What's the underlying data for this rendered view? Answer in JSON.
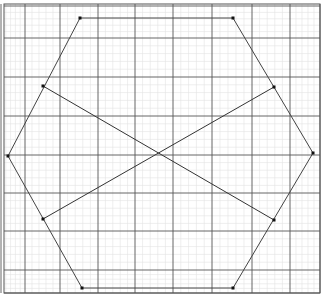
{
  "figure": {
    "grid": {
      "minor_step": 7.7,
      "major_x": [
        1,
        25,
        60,
        98,
        135,
        173,
        212,
        252,
        290,
        320
      ],
      "major_y": [
        6,
        38,
        77,
        116,
        155,
        193,
        231,
        270,
        293
      ],
      "minor_color": "#e2e2e2",
      "major_color": "#555555",
      "border": [
        4,
        4,
        320,
        293
      ]
    },
    "hexagon": {
      "vertices": [
        [
          80,
          18
        ],
        [
          233,
          18
        ],
        [
          313,
          153
        ],
        [
          233,
          288
        ],
        [
          82,
          288
        ],
        [
          8,
          156
        ]
      ],
      "stroke": "#444444"
    },
    "segments": [
      {
        "from": [
          43,
          86
        ],
        "to": [
          274,
          220
        ]
      },
      {
        "from": [
          43,
          219
        ],
        "to": [
          274,
          87
        ]
      }
    ],
    "points": [
      [
        80,
        18
      ],
      [
        233,
        18
      ],
      [
        313,
        153
      ],
      [
        233,
        288
      ],
      [
        82,
        288
      ],
      [
        8,
        156
      ],
      [
        43,
        86
      ],
      [
        274,
        87
      ],
      [
        43,
        219
      ],
      [
        274,
        220
      ]
    ],
    "line_color": "#333333",
    "point_color": "#111111"
  }
}
